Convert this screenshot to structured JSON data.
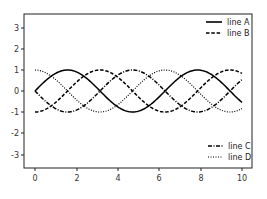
{
  "chart_data": {
    "type": "line",
    "title": "",
    "xlabel": "",
    "ylabel": "",
    "xlim": [
      -0.5,
      10.5
    ],
    "ylim": [
      -3.6,
      3.6
    ],
    "grid": false,
    "xticks": [
      "0",
      "2",
      "4",
      "6",
      "8",
      "10"
    ],
    "yticks": [
      "3",
      "2",
      "1",
      "0",
      "-1",
      "-2",
      "-3"
    ],
    "series": [
      {
        "name": "line A",
        "style": "solid",
        "function": "sin(x)",
        "color": "#000000"
      },
      {
        "name": "line B",
        "style": "dashed",
        "function": "-cos(x)",
        "color": "#000000"
      },
      {
        "name": "line C",
        "style": "dashdot",
        "function": "-sin(x)",
        "color": "#000000"
      },
      {
        "name": "line D",
        "style": "dotted",
        "function": "cos(x)",
        "color": "#000000"
      }
    ],
    "x_range": [
      0,
      10
    ],
    "legends": [
      {
        "position": "upper right",
        "entries": [
          "line A",
          "line B"
        ]
      },
      {
        "position": "lower right",
        "entries": [
          "line C",
          "line D"
        ]
      }
    ]
  },
  "legend_top": {
    "a": "line A",
    "b": "line B"
  },
  "legend_bottom": {
    "c": "line C",
    "d": "line D"
  },
  "ticks": {
    "x": [
      "0",
      "2",
      "4",
      "6",
      "8",
      "10"
    ],
    "y": [
      "3",
      "2",
      "1",
      "0",
      "-1",
      "-2",
      "-3"
    ]
  }
}
